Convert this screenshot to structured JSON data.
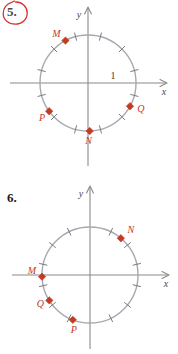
{
  "page": {
    "background_color": "#ffffff",
    "text_color": "#1a1a1a",
    "axis_color": "#8a8a8a",
    "circle_color": "#a8a8b0",
    "tick_color": "#7a7a82",
    "point_color": "#c23b22",
    "label_color": "#c0392b",
    "annotation_color": "#d0342c"
  },
  "problems": [
    {
      "number": "5.",
      "circled": true,
      "axis_labels": {
        "x": "x",
        "y": "y"
      },
      "unit_label": "1",
      "points": [
        {
          "name": "M",
          "angle_deg": 118
        },
        {
          "name": "N",
          "angle_deg": 272
        },
        {
          "name": "P",
          "angle_deg": 216
        },
        {
          "name": "Q",
          "angle_deg": 331
        }
      ],
      "tick_divisions": 12,
      "tick_label_note": "circle divided into 12 equal arcs"
    },
    {
      "number": "6.",
      "circled": false,
      "axis_labels": {
        "x": "x",
        "y": "y"
      },
      "unit_label": "",
      "points": [
        {
          "name": "M",
          "angle_deg": 182
        },
        {
          "name": "N",
          "angle_deg": 50
        },
        {
          "name": "P",
          "angle_deg": 249
        },
        {
          "name": "Q",
          "angle_deg": 212
        }
      ],
      "tick_divisions": 14,
      "tick_label_note": "circle divided into 14 equal arcs"
    }
  ]
}
